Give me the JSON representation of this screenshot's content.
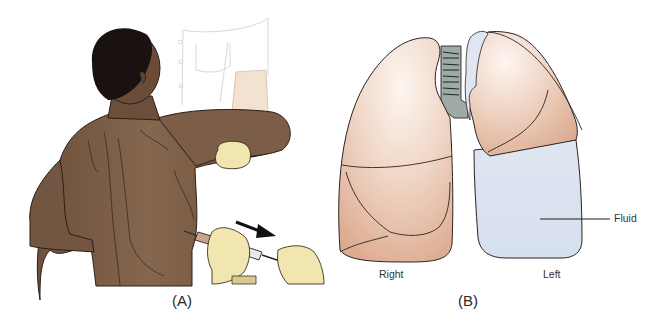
{
  "figure": {
    "panels": [
      {
        "id": "A",
        "caption": "(A)",
        "description": "Patient seated with arm raised over shoulder while clinician inserts needle/syringe into posterior chest wall; arrow indicates withdrawal direction"
      },
      {
        "id": "B",
        "caption": "(B)",
        "description": "Frontal view of lungs with trachea; left lung lower lobe replaced by pleural fluid",
        "labels": {
          "right_lung": "Right",
          "left_lung": "Left",
          "fluid": "Fluid"
        }
      }
    ]
  },
  "colors": {
    "skin": "#7a5a43",
    "skin_shadow": "#5e4332",
    "hair": "#1a1210",
    "glove": "#f2e6b0",
    "lung": "#e9c3ac",
    "lung_highlight": "#fbf1ea",
    "fluid": "#dde6f2",
    "trachea": "#9aa7a3",
    "outline": "#2b2424"
  }
}
